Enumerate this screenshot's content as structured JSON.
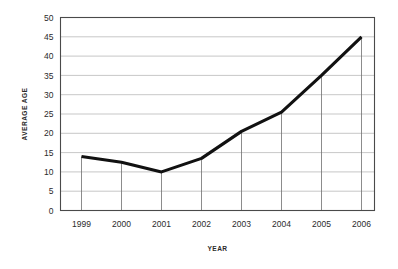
{
  "chart_data": {
    "type": "line",
    "title": "",
    "xlabel": "YEAR",
    "ylabel": "AVERAGE AGE",
    "categories": [
      "1999",
      "2000",
      "2001",
      "2002",
      "2003",
      "2004",
      "2005",
      "2006"
    ],
    "values": [
      14,
      12.5,
      10,
      13.5,
      20.5,
      25.5,
      35,
      45
    ],
    "series": [
      {
        "name": "Average age",
        "values": [
          14,
          12.5,
          10,
          13.5,
          20.5,
          25.5,
          35,
          45
        ]
      }
    ],
    "ylim": [
      0,
      50
    ],
    "y_ticks": [
      0,
      5,
      10,
      15,
      20,
      25,
      30,
      35,
      40,
      45,
      50
    ],
    "y_tick_labels": [
      "0",
      "5",
      "10",
      "15",
      "20",
      "25",
      "30",
      "35",
      "40",
      "45",
      "50"
    ],
    "x_tick_labels": [
      "1999",
      "2000",
      "2001",
      "2002",
      "2003",
      "2004",
      "2005",
      "2006"
    ],
    "grid": "horizontal-and-vertical",
    "legend": "none",
    "colors": {
      "line": "#111111",
      "horizontal_gridline": "#b9b9b9",
      "vertical_gridline": "#6e6e6e",
      "frame": "#4a4a4a",
      "text": "#2b2b2b",
      "background": "#ffffff"
    }
  }
}
